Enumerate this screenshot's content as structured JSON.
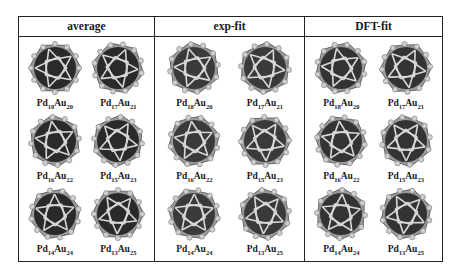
{
  "figure": {
    "columns": [
      {
        "header": "average",
        "shade": "#2a2a2a",
        "items": [
          {
            "pd": "18",
            "au": "20"
          },
          {
            "pd": "17",
            "au": "21"
          },
          {
            "pd": "16",
            "au": "22"
          },
          {
            "pd": "15",
            "au": "23"
          },
          {
            "pd": "14",
            "au": "24"
          },
          {
            "pd": "13",
            "au": "25"
          }
        ]
      },
      {
        "header": "exp-fit",
        "shade": "#3a3a3a",
        "items": [
          {
            "pd": "18",
            "au": "20"
          },
          {
            "pd": "17",
            "au": "21"
          },
          {
            "pd": "16",
            "au": "22"
          },
          {
            "pd": "15",
            "au": "23"
          },
          {
            "pd": "14",
            "au": "24"
          },
          {
            "pd": "13",
            "au": "25"
          }
        ]
      },
      {
        "header": "DFT-fit",
        "shade": "#333333",
        "items": [
          {
            "pd": "18",
            "au": "20"
          },
          {
            "pd": "17",
            "au": "21"
          },
          {
            "pd": "16",
            "au": "22"
          },
          {
            "pd": "15",
            "au": "23"
          },
          {
            "pd": "14",
            "au": "24"
          },
          {
            "pd": "13",
            "au": "25"
          }
        ]
      }
    ],
    "element_a": "Pd",
    "element_b": "Au"
  }
}
